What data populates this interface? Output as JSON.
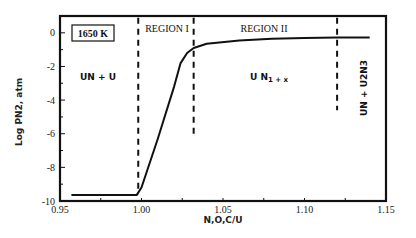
{
  "chart_data": {
    "type": "line",
    "title": "",
    "xlabel": "N,O,C/U",
    "ylabel": "Log PN2, atm",
    "xlim": [
      0.95,
      1.15
    ],
    "ylim": [
      -10,
      1
    ],
    "grid": false,
    "legend": null,
    "x_ticks": [
      0.95,
      1.0,
      1.05,
      1.1,
      1.15
    ],
    "x_tick_labels": [
      "0.95",
      "1.00",
      "1.05",
      "1.10",
      "1.15"
    ],
    "y_ticks": [
      0,
      -2,
      -4,
      -6,
      -8,
      -10
    ],
    "y_tick_labels": [
      "0",
      "-2",
      "-4",
      "-6",
      "-8",
      "-10"
    ],
    "series": [
      {
        "name": "Log PN2",
        "x": [
          0.957,
          0.997,
          1.0,
          1.01,
          1.02,
          1.024,
          1.028,
          1.032,
          1.04,
          1.06,
          1.08,
          1.1,
          1.12,
          1.14
        ],
        "y": [
          -9.65,
          -9.65,
          -9.2,
          -6.3,
          -3.2,
          -1.8,
          -1.2,
          -0.9,
          -0.65,
          -0.45,
          -0.35,
          -0.3,
          -0.28,
          -0.27
        ]
      }
    ],
    "vlines": [
      {
        "x": 0.998,
        "y_from": -9.6,
        "y_to": 0.9,
        "style": "dashed",
        "label": "left boundary of Region I"
      },
      {
        "x": 1.032,
        "y_from": -6.3,
        "y_to": 0.9,
        "style": "dashed",
        "label": "Region I / Region II boundary"
      },
      {
        "x": 1.12,
        "y_from": -4.6,
        "y_to": 0.9,
        "style": "dashed",
        "label": "Region II upper boundary"
      }
    ],
    "annotations": [
      {
        "text": "1650 K",
        "x": 0.966,
        "y": -0.05,
        "boxed": true
      },
      {
        "text": "REGION I",
        "x": 1.0155,
        "y": 0.2
      },
      {
        "text": "REGION II",
        "x": 1.075,
        "y": 0.2
      },
      {
        "text": "UN + U",
        "x": 0.971,
        "y": -2.6
      },
      {
        "text": "UN1+x",
        "x": 1.063,
        "y": -2.6
      },
      {
        "text": "UN + U2N3",
        "x": 1.135,
        "y": -2.6,
        "rotated": true
      }
    ]
  },
  "labels": {
    "temperature": "1650 K",
    "region1": "REGION I",
    "region2": "REGION II",
    "phase_left": "UN + U",
    "phase_mid_base": "U N",
    "phase_mid_sub": "1 + x",
    "phase_right": "UN + U2N3",
    "xlabel": "N,O,C/U",
    "ylabel": "Log PN2, atm"
  },
  "colors": {
    "line": "#111111",
    "axes": "#111111",
    "background": "#ffffff"
  }
}
